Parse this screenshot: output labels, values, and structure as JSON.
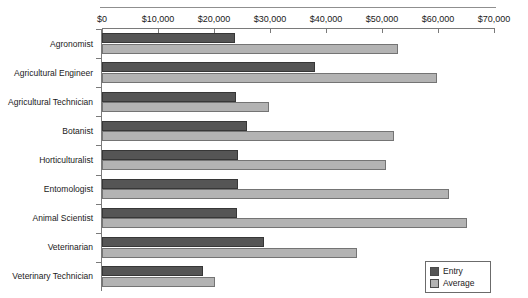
{
  "chart_data": {
    "type": "bar",
    "orientation": "horizontal",
    "title": "",
    "xlabel": "",
    "ylabel": "",
    "xlim": [
      0,
      70000
    ],
    "xticks": [
      0,
      10000,
      20000,
      30000,
      40000,
      50000,
      60000,
      70000
    ],
    "xtick_labels": [
      "$0",
      "$10,000",
      "$20,000",
      "$30,000",
      "$40,000",
      "$50,000",
      "$60,000",
      "$70,000"
    ],
    "grid": false,
    "legend_position": "bottom-right",
    "categories": [
      "Agronomist",
      "Agricultural Engineer",
      "Agricultural Technician",
      "Botanist",
      "Horticulturalist",
      "Entomologist",
      "Animal Scientist",
      "Veterinarian",
      "Veterinary Technician"
    ],
    "series": [
      {
        "name": "Entry",
        "color": "#555555",
        "values": [
          23750,
          38000,
          23900,
          25900,
          24300,
          24200,
          24100,
          29000,
          18000
        ]
      },
      {
        "name": "Average",
        "color": "#b3b3b3",
        "values": [
          52850,
          59800,
          29800,
          52150,
          50700,
          62000,
          65200,
          45500,
          20200
        ]
      }
    ]
  },
  "legend": {
    "items": [
      {
        "label": "Entry",
        "color": "#555555"
      },
      {
        "label": "Average",
        "color": "#b3b3b3"
      }
    ]
  }
}
